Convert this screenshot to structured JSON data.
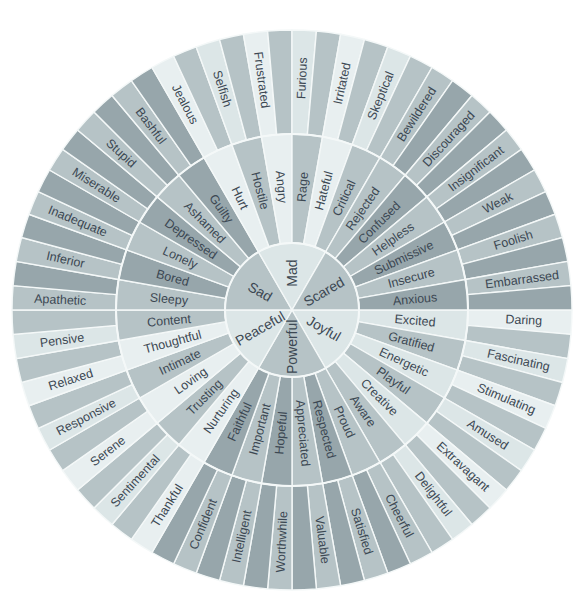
{
  "diagram": {
    "type": "emotion-wheel",
    "center": [
      292,
      310
    ],
    "radii": {
      "core": 67,
      "middle": 176,
      "outer": 280
    },
    "colors": {
      "dark": "#97a6ab",
      "mid": "#b6c3c6",
      "light": "#dce6e7",
      "lighter": "#e8eff0",
      "text": "#3c4853",
      "divider": "#f4f8f8"
    },
    "core": [
      {
        "label": "Joyful",
        "start": 0,
        "tone": "light",
        "secondary": [
          {
            "label": "Excited",
            "tone": "light",
            "outer": {
              "label": "Daring",
              "tone": "lighter",
              "blank_tone": "mid"
            }
          },
          {
            "label": "Gratified",
            "tone": "mid",
            "outer": {
              "label": "Fascinating",
              "tone": "light",
              "blank_tone": "mid"
            }
          },
          {
            "label": "Energetic",
            "tone": "light",
            "outer": {
              "label": "Stimulating",
              "tone": "lighter",
              "blank_tone": "mid"
            }
          },
          {
            "label": "Playful",
            "tone": "mid",
            "outer": {
              "label": "Amused",
              "tone": "light",
              "blank_tone": "mid"
            }
          },
          {
            "label": "Creative",
            "tone": "light",
            "outer": {
              "label": "Extravagant",
              "tone": "lighter",
              "blank_tone": "mid"
            }
          },
          {
            "label": "Aware",
            "tone": "mid",
            "outer": {
              "label": "Delightful",
              "tone": "light",
              "blank_tone": "mid"
            }
          }
        ]
      },
      {
        "label": "Powerful",
        "start": 60,
        "tone": "mid",
        "secondary": [
          {
            "label": "Proud",
            "tone": "mid",
            "outer": {
              "label": "Cheerful",
              "tone": "mid",
              "blank_tone": "dark"
            }
          },
          {
            "label": "Respected",
            "tone": "dark",
            "outer": {
              "label": "Satisfied",
              "tone": "mid",
              "blank_tone": "dark"
            }
          },
          {
            "label": "Appreciated",
            "tone": "mid",
            "outer": {
              "label": "Valuable",
              "tone": "mid",
              "blank_tone": "dark"
            }
          },
          {
            "label": "Hopeful",
            "tone": "dark",
            "outer": {
              "label": "Worthwhile",
              "tone": "mid",
              "blank_tone": "dark"
            }
          },
          {
            "label": "Important",
            "tone": "mid",
            "outer": {
              "label": "Intelligent",
              "tone": "mid",
              "blank_tone": "dark"
            }
          },
          {
            "label": "Faithful",
            "tone": "dark",
            "outer": {
              "label": "Confident",
              "tone": "mid",
              "blank_tone": "dark"
            }
          }
        ]
      },
      {
        "label": "Peaceful",
        "start": 120,
        "tone": "light",
        "secondary": [
          {
            "label": "Nurturing",
            "tone": "lighter",
            "outer": {
              "label": "Thankful",
              "tone": "lighter",
              "blank_tone": "mid"
            }
          },
          {
            "label": "Trusting",
            "tone": "mid",
            "outer": {
              "label": "Sentimental",
              "tone": "light",
              "blank_tone": "mid"
            }
          },
          {
            "label": "Loving",
            "tone": "lighter",
            "outer": {
              "label": "Serene",
              "tone": "lighter",
              "blank_tone": "mid"
            }
          },
          {
            "label": "Intimate",
            "tone": "mid",
            "outer": {
              "label": "Responsive",
              "tone": "light",
              "blank_tone": "mid"
            }
          },
          {
            "label": "Thoughtful",
            "tone": "lighter",
            "outer": {
              "label": "Relaxed",
              "tone": "lighter",
              "blank_tone": "mid"
            }
          },
          {
            "label": "Content",
            "tone": "mid",
            "outer": {
              "label": "Pensive",
              "tone": "light",
              "blank_tone": "mid"
            }
          }
        ]
      },
      {
        "label": "Sad",
        "start": 180,
        "tone": "mid",
        "secondary": [
          {
            "label": "Sleepy",
            "tone": "mid",
            "outer": {
              "label": "Apathetic",
              "tone": "mid",
              "blank_tone": "dark"
            }
          },
          {
            "label": "Bored",
            "tone": "dark",
            "outer": {
              "label": "Inferior",
              "tone": "mid",
              "blank_tone": "dark"
            }
          },
          {
            "label": "Lonely",
            "tone": "mid",
            "outer": {
              "label": "Inadequate",
              "tone": "mid",
              "blank_tone": "dark"
            }
          },
          {
            "label": "Depressed",
            "tone": "dark",
            "outer": {
              "label": "Miserable",
              "tone": "mid",
              "blank_tone": "dark"
            }
          },
          {
            "label": "Ashamed",
            "tone": "mid",
            "outer": {
              "label": "Stupid",
              "tone": "mid",
              "blank_tone": "dark"
            }
          },
          {
            "label": "Guilty",
            "tone": "dark",
            "outer": {
              "label": "Bashful",
              "tone": "mid",
              "blank_tone": "dark"
            }
          }
        ]
      },
      {
        "label": "Mad",
        "start": 240,
        "tone": "light",
        "secondary": [
          {
            "label": "Hurt",
            "tone": "lighter",
            "outer": {
              "label": "Jealous",
              "tone": "lighter",
              "blank_tone": "mid"
            }
          },
          {
            "label": "Hostile",
            "tone": "mid",
            "outer": {
              "label": "Selfish",
              "tone": "light",
              "blank_tone": "mid"
            }
          },
          {
            "label": "Angry",
            "tone": "lighter",
            "outer": {
              "label": "Frustrated",
              "tone": "lighter",
              "blank_tone": "mid"
            }
          },
          {
            "label": "Rage",
            "tone": "mid",
            "outer": {
              "label": "Furious",
              "tone": "light",
              "blank_tone": "mid"
            }
          },
          {
            "label": "Hateful",
            "tone": "lighter",
            "outer": {
              "label": "Irritated",
              "tone": "lighter",
              "blank_tone": "mid"
            }
          },
          {
            "label": "Critical",
            "tone": "mid",
            "outer": {
              "label": "Skeptical",
              "tone": "light",
              "blank_tone": "mid"
            }
          }
        ]
      },
      {
        "label": "Scared",
        "start": 300,
        "tone": "mid",
        "secondary": [
          {
            "label": "Rejected",
            "tone": "mid",
            "outer": {
              "label": "Bewildered",
              "tone": "mid",
              "blank_tone": "dark"
            }
          },
          {
            "label": "Confused",
            "tone": "dark",
            "outer": {
              "label": "Discouraged",
              "tone": "mid",
              "blank_tone": "dark"
            }
          },
          {
            "label": "Helpless",
            "tone": "mid",
            "outer": {
              "label": "Insignificant",
              "tone": "mid",
              "blank_tone": "dark"
            }
          },
          {
            "label": "Submissive",
            "tone": "dark",
            "outer": {
              "label": "Weak",
              "tone": "mid",
              "blank_tone": "dark"
            }
          },
          {
            "label": "Insecure",
            "tone": "mid",
            "outer": {
              "label": "Foolish",
              "tone": "mid",
              "blank_tone": "dark"
            }
          },
          {
            "label": "Anxious",
            "tone": "dark",
            "outer": {
              "label": "Embarrassed",
              "tone": "mid",
              "blank_tone": "dark"
            }
          }
        ]
      }
    ]
  }
}
